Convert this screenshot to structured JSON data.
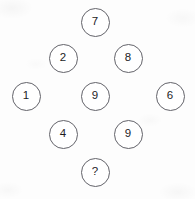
{
  "puzzle": {
    "canvas": {
      "width": 195,
      "height": 199,
      "background": "#fdfdfd"
    },
    "style": {
      "circle_diameter": 29,
      "circle_stroke_color": "#63636a",
      "circle_fill_color": "#ffffff",
      "label_color": "#1d1d1f"
    },
    "unknown_marker": "?",
    "nodes": [
      {
        "id": "node-top",
        "label": "7",
        "cx": 95,
        "cy": 22,
        "row": "top",
        "position": "top-apex"
      },
      {
        "id": "node-upper-left",
        "label": "2",
        "cx": 63,
        "cy": 58,
        "row": "upper",
        "position": "upper-left"
      },
      {
        "id": "node-upper-right",
        "label": "8",
        "cx": 128,
        "cy": 58,
        "row": "upper",
        "position": "upper-right"
      },
      {
        "id": "node-middle-left",
        "label": "1",
        "cx": 26,
        "cy": 96,
        "row": "middle",
        "position": "middle-left"
      },
      {
        "id": "node-middle-center",
        "label": "9",
        "cx": 95,
        "cy": 96,
        "row": "middle",
        "position": "middle-center"
      },
      {
        "id": "node-middle-right",
        "label": "6",
        "cx": 170,
        "cy": 96,
        "row": "middle",
        "position": "middle-right"
      },
      {
        "id": "node-lower-left",
        "label": "4",
        "cx": 63,
        "cy": 134,
        "row": "lower",
        "position": "lower-left"
      },
      {
        "id": "node-lower-right",
        "label": "9",
        "cx": 128,
        "cy": 134,
        "row": "lower",
        "position": "lower-right"
      },
      {
        "id": "node-bottom",
        "label": "?",
        "cx": 95,
        "cy": 172,
        "row": "bottom",
        "position": "bottom-apex"
      }
    ]
  }
}
